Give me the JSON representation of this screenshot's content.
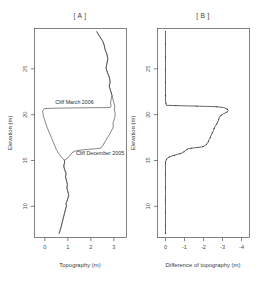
{
  "figure": {
    "background": "#ffffff",
    "line_color": "#3a3a3a",
    "axis_color": "#4d4d4d",
    "text_color": "#3d3d3d"
  },
  "panels": [
    {
      "id": "A",
      "title": "[ A ]",
      "xlabel": "Topography (m)",
      "ylabel": "Elevation (m)",
      "xticks": [
        "0",
        "1",
        "2",
        "3"
      ],
      "yticks": [
        "10",
        "15",
        "20",
        "25"
      ]
    },
    {
      "id": "B",
      "title": "[ B ]",
      "xlabel": "Difference of topography (m)",
      "ylabel": "Elevation (m)",
      "xticks": [
        "0",
        "-1",
        "-2",
        "-3",
        "-4"
      ],
      "yticks": [
        "10",
        "15",
        "20",
        "25"
      ]
    }
  ],
  "annotations": {
    "cliff_march": "Cliff March 2006",
    "cliff_december": "Cliff December 2005"
  },
  "chart_data": [
    {
      "type": "line",
      "panel": "A",
      "title": "[ A ]",
      "xlabel": "Topography (m)",
      "ylabel": "Elevation (m)",
      "xlim": [
        -0.45,
        3.55
      ],
      "ylim": [
        6.6,
        29.4
      ],
      "xticks": [
        0,
        1,
        2,
        3
      ],
      "yticks": [
        10,
        15,
        20,
        25
      ],
      "grid": false,
      "legend": "none",
      "annotations": [
        {
          "text": "Cliff March 2006",
          "x": 0.45,
          "y": 21.15
        },
        {
          "text": "Cliff December 2005",
          "x": 1.35,
          "y": 15.55
        }
      ],
      "series": [
        {
          "name": "Cliff March 2006",
          "points": [
            [
              2.26,
              29.05
            ],
            [
              2.38,
              28.55
            ],
            [
              2.5,
              28.1
            ],
            [
              2.58,
              27.6
            ],
            [
              2.62,
              27.1
            ],
            [
              2.7,
              26.6
            ],
            [
              2.74,
              26.1
            ],
            [
              2.7,
              25.6
            ],
            [
              2.66,
              25.1
            ],
            [
              2.72,
              24.6
            ],
            [
              2.8,
              24.1
            ],
            [
              2.84,
              23.6
            ],
            [
              2.8,
              23.1
            ],
            [
              2.86,
              22.6
            ],
            [
              2.92,
              22.1
            ],
            [
              2.88,
              21.7
            ],
            [
              2.86,
              21.3
            ],
            [
              2.88,
              20.95
            ],
            [
              2.84,
              20.78
            ],
            [
              2.1,
              20.76
            ],
            [
              1.4,
              20.74
            ],
            [
              0.8,
              20.72
            ],
            [
              0.3,
              20.7
            ],
            [
              -0.02,
              20.66
            ],
            [
              -0.1,
              20.4
            ],
            [
              -0.06,
              19.8
            ],
            [
              0.02,
              19.2
            ],
            [
              0.1,
              18.6
            ],
            [
              0.2,
              18.0
            ],
            [
              0.3,
              17.4
            ],
            [
              0.4,
              16.8
            ],
            [
              0.5,
              16.2
            ],
            [
              0.62,
              15.7
            ],
            [
              0.74,
              15.3
            ],
            [
              0.84,
              15.08
            ],
            [
              0.86,
              14.8
            ],
            [
              0.82,
              14.4
            ],
            [
              0.86,
              14.0
            ],
            [
              0.92,
              13.6
            ],
            [
              0.9,
              13.2
            ],
            [
              0.94,
              12.8
            ],
            [
              0.98,
              12.4
            ],
            [
              0.96,
              12.0
            ],
            [
              1.0,
              11.6
            ],
            [
              1.04,
              11.2
            ],
            [
              1.0,
              10.85
            ],
            [
              0.96,
              10.55
            ],
            [
              0.92,
              10.3
            ],
            [
              0.94,
              10.05
            ],
            [
              0.9,
              9.7
            ],
            [
              0.86,
              9.3
            ],
            [
              0.82,
              8.9
            ],
            [
              0.78,
              8.5
            ],
            [
              0.74,
              8.1
            ],
            [
              0.7,
              7.7
            ],
            [
              0.66,
              7.35
            ],
            [
              0.62,
              7.05
            ]
          ]
        },
        {
          "name": "Cliff December 2005",
          "points": [
            [
              2.26,
              29.05
            ],
            [
              2.38,
              28.55
            ],
            [
              2.5,
              28.1
            ],
            [
              2.58,
              27.6
            ],
            [
              2.62,
              27.1
            ],
            [
              2.7,
              26.6
            ],
            [
              2.74,
              26.1
            ],
            [
              2.7,
              25.6
            ],
            [
              2.66,
              25.1
            ],
            [
              2.72,
              24.6
            ],
            [
              2.8,
              24.1
            ],
            [
              2.84,
              23.6
            ],
            [
              2.8,
              23.1
            ],
            [
              2.86,
              22.6
            ],
            [
              2.92,
              22.1
            ],
            [
              2.96,
              21.7
            ],
            [
              3.0,
              21.3
            ],
            [
              3.04,
              20.9
            ],
            [
              3.02,
              20.5
            ],
            [
              3.06,
              20.1
            ],
            [
              3.04,
              19.7
            ],
            [
              3.0,
              19.35
            ],
            [
              2.96,
              19.05
            ],
            [
              2.98,
              18.75
            ],
            [
              2.94,
              18.45
            ],
            [
              2.88,
              18.2
            ],
            [
              2.84,
              17.95
            ],
            [
              2.78,
              17.7
            ],
            [
              2.7,
              17.45
            ],
            [
              2.66,
              17.2
            ],
            [
              2.6,
              17.0
            ],
            [
              2.56,
              16.8
            ],
            [
              2.52,
              16.62
            ],
            [
              2.48,
              16.48
            ],
            [
              2.44,
              16.36
            ],
            [
              2.3,
              16.3
            ],
            [
              2.0,
              16.24
            ],
            [
              1.7,
              16.18
            ],
            [
              1.45,
              16.1
            ],
            [
              1.28,
              16.0
            ],
            [
              1.18,
              15.85
            ],
            [
              1.12,
              15.66
            ],
            [
              1.06,
              15.45
            ],
            [
              1.0,
              15.28
            ],
            [
              0.92,
              15.15
            ],
            [
              0.86,
              15.08
            ],
            [
              0.86,
              14.8
            ],
            [
              0.82,
              14.4
            ],
            [
              0.86,
              14.0
            ],
            [
              0.92,
              13.6
            ],
            [
              0.9,
              13.2
            ],
            [
              0.94,
              12.8
            ],
            [
              0.98,
              12.4
            ],
            [
              0.96,
              12.0
            ],
            [
              1.0,
              11.6
            ],
            [
              1.04,
              11.2
            ],
            [
              1.0,
              10.85
            ],
            [
              0.96,
              10.55
            ],
            [
              0.92,
              10.3
            ],
            [
              0.94,
              10.05
            ],
            [
              0.9,
              9.7
            ],
            [
              0.86,
              9.3
            ],
            [
              0.82,
              8.9
            ],
            [
              0.78,
              8.5
            ],
            [
              0.74,
              8.1
            ],
            [
              0.7,
              7.7
            ],
            [
              0.66,
              7.35
            ],
            [
              0.62,
              7.05
            ]
          ]
        }
      ]
    },
    {
      "type": "line",
      "panel": "B",
      "title": "[ B ]",
      "xlabel": "Difference of topography (m)",
      "ylabel": "Elevation (m)",
      "xlim": [
        0.42,
        -4.42
      ],
      "ylim": [
        6.6,
        29.4
      ],
      "xticks": [
        0,
        -1,
        -2,
        -3,
        -4
      ],
      "yticks": [
        10,
        15,
        20,
        25
      ],
      "grid": false,
      "legend": "none",
      "series": [
        {
          "name": "Difference of topography",
          "points": [
            [
              0.0,
              29.05
            ],
            [
              0.0,
              28.4
            ],
            [
              0.0,
              27.7
            ],
            [
              0.0,
              27.0
            ],
            [
              0.0,
              26.3
            ],
            [
              0.0,
              25.6
            ],
            [
              0.0,
              24.9
            ],
            [
              0.0,
              24.2
            ],
            [
              0.0,
              23.5
            ],
            [
              0.0,
              22.8
            ],
            [
              0.0,
              22.1
            ],
            [
              0.0,
              21.6
            ],
            [
              -0.02,
              21.25
            ],
            [
              -0.06,
              21.02
            ],
            [
              -0.55,
              20.99
            ],
            [
              -1.1,
              20.96
            ],
            [
              -1.65,
              20.93
            ],
            [
              -2.2,
              20.9
            ],
            [
              -2.7,
              20.86
            ],
            [
              -3.05,
              20.78
            ],
            [
              -3.25,
              20.62
            ],
            [
              -3.3,
              20.44
            ],
            [
              -3.22,
              20.26
            ],
            [
              -3.06,
              20.1
            ],
            [
              -2.92,
              19.92
            ],
            [
              -2.84,
              19.72
            ],
            [
              -2.8,
              19.5
            ],
            [
              -2.76,
              19.25
            ],
            [
              -2.7,
              19.0
            ],
            [
              -2.62,
              18.75
            ],
            [
              -2.56,
              18.5
            ],
            [
              -2.52,
              18.25
            ],
            [
              -2.46,
              18.0
            ],
            [
              -2.4,
              17.76
            ],
            [
              -2.36,
              17.52
            ],
            [
              -2.3,
              17.3
            ],
            [
              -2.26,
              17.1
            ],
            [
              -2.22,
              16.92
            ],
            [
              -2.16,
              16.76
            ],
            [
              -2.08,
              16.62
            ],
            [
              -1.98,
              16.52
            ],
            [
              -1.86,
              16.46
            ],
            [
              -1.7,
              16.42
            ],
            [
              -1.52,
              16.38
            ],
            [
              -1.36,
              16.34
            ],
            [
              -1.22,
              16.3
            ],
            [
              -1.14,
              16.22
            ],
            [
              -1.06,
              16.1
            ],
            [
              -0.98,
              15.96
            ],
            [
              -0.88,
              15.84
            ],
            [
              -0.76,
              15.74
            ],
            [
              -0.62,
              15.66
            ],
            [
              -0.48,
              15.58
            ],
            [
              -0.34,
              15.5
            ],
            [
              -0.22,
              15.4
            ],
            [
              -0.12,
              15.28
            ],
            [
              -0.06,
              15.14
            ],
            [
              -0.02,
              14.98
            ],
            [
              0.0,
              14.8
            ],
            [
              0.0,
              14.2
            ],
            [
              0.0,
              13.5
            ],
            [
              0.0,
              12.8
            ],
            [
              0.0,
              12.1
            ],
            [
              0.0,
              11.4
            ],
            [
              0.0,
              10.7
            ],
            [
              0.0,
              10.0
            ],
            [
              0.0,
              9.3
            ],
            [
              0.0,
              8.6
            ],
            [
              0.0,
              7.9
            ],
            [
              0.0,
              7.2
            ],
            [
              0.0,
              7.05
            ]
          ]
        }
      ]
    }
  ]
}
